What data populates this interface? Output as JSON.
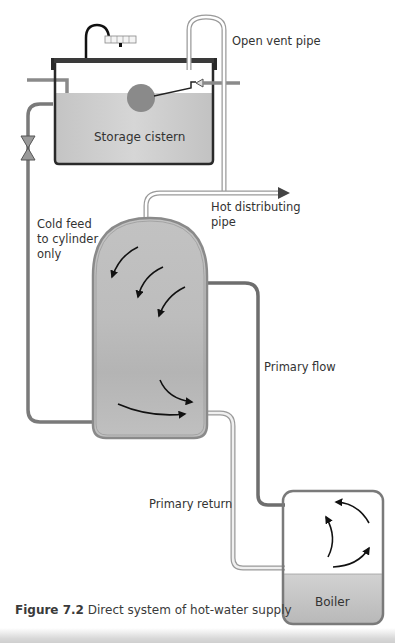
{
  "figure": {
    "number_label": "Figure 7.2",
    "caption_text": " Direct system of hot-water supply"
  },
  "labels": {
    "open_vent_pipe": "Open vent pipe",
    "storage_cistern": "Storage cistern",
    "hot_distributing_pipe": "Hot distributing\npipe",
    "cold_feed": "Cold feed\nto cylinder\nonly",
    "primary_flow": "Primary flow",
    "primary_return": "Primary return",
    "boiler": "Boiler"
  },
  "colors": {
    "water": "#c8c8c8",
    "pipe_dark": "#7a7a7a",
    "pipe_light": "#b0b0b0",
    "outline": "#2a2a2a",
    "cylinder_fill": "#bcbcbc"
  }
}
